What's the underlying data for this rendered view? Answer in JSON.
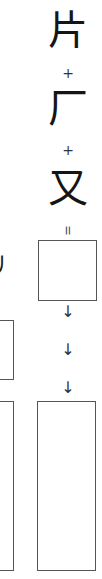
{
  "components": [
    {
      "char": "片"
    },
    {
      "char": "厂"
    },
    {
      "char": "又"
    }
  ],
  "operators": {
    "plus": "+",
    "equals": "="
  },
  "arrows": [
    "↓",
    "↓",
    "↓"
  ],
  "left_column": {
    "partial_stroke": "丿"
  },
  "colors": {
    "stroke": "#555555",
    "text": "#151515",
    "background": "#ffffff"
  }
}
